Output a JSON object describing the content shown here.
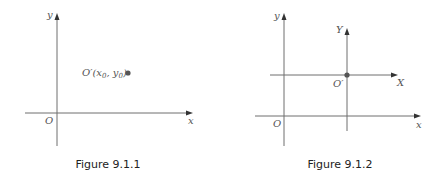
{
  "figures": [
    {
      "caption": "Figure 9.1.1",
      "labels": {
        "origin": "O",
        "x_axis": "x",
        "y_axis": "y",
        "point_prefix": "O′(x",
        "point_sub0": "0",
        "point_mid": ", y",
        "point_sub1": "0",
        "point_suffix": ")"
      }
    },
    {
      "caption": "Figure 9.1.2",
      "labels": {
        "origin": "O",
        "x_axis": "x",
        "y_axis": "y",
        "new_origin": "O′",
        "new_x_axis": "X",
        "new_y_axis": "Y"
      }
    }
  ],
  "colors": {
    "axis": "#6f6f6f",
    "point": "#555555",
    "caption": "#222222"
  }
}
